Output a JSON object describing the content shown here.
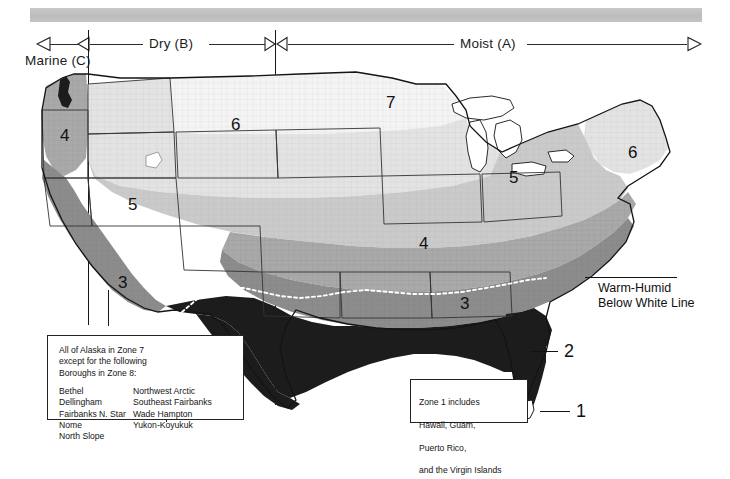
{
  "figure": {
    "type": "climate-zone-map",
    "region": "United States",
    "title": ""
  },
  "axis": {
    "marine_label": "Marine (C)",
    "dry_label": "Dry (B)",
    "moist_label": "Moist (A)",
    "marine_arrow": "arrow-left",
    "moist_arrow": "arrow-right",
    "divider_1_x": 88,
    "divider_2_x": 275
  },
  "zones": {
    "labels": [
      {
        "id": "zone-4-nw",
        "text": "4",
        "x": 60,
        "y": 127
      },
      {
        "id": "zone-5-west",
        "text": "5",
        "x": 128,
        "y": 196
      },
      {
        "id": "zone-3-ca",
        "text": "3",
        "x": 118,
        "y": 274
      },
      {
        "id": "zone-6-rockies",
        "text": "6",
        "x": 231,
        "y": 116
      },
      {
        "id": "zone-7-north",
        "text": "7",
        "x": 386,
        "y": 94
      },
      {
        "id": "zone-4-plains",
        "text": "4",
        "x": 419,
        "y": 235
      },
      {
        "id": "zone-5-midwest",
        "text": "5",
        "x": 509,
        "y": 169
      },
      {
        "id": "zone-6-northeast",
        "text": "6",
        "x": 628,
        "y": 144
      },
      {
        "id": "zone-3-south",
        "text": "3",
        "x": 460,
        "y": 295
      }
    ],
    "callouts": [
      {
        "id": "zone-2-callout",
        "text": "2",
        "x": 564,
        "y": 341,
        "leader_x": 530,
        "leader_y": 351,
        "leader_w": 28
      },
      {
        "id": "zone-1-callout",
        "text": "1",
        "x": 576,
        "y": 401,
        "leader_x": 540,
        "leader_y": 411,
        "leader_w": 30
      }
    ]
  },
  "annotations": {
    "warm_humid": {
      "line1": "Warm-Humid",
      "line2": "Below White Line",
      "x": 598,
      "y": 281,
      "leader_x": 585,
      "leader_y": 277,
      "leader_w": 92
    }
  },
  "legend_alaska": {
    "heading": "All of Alaska in Zone 7\nexcept for the following\nBoroughs in Zone 8:",
    "column_left": [
      "Bethel",
      "Dellingham",
      "Fairbanks N. Star",
      "Nome",
      "North Slope"
    ],
    "column_right": [
      "Northwest Arctic",
      "Southeast Fairbanks",
      "Wade Hampton",
      "Yukon-Koyukuk"
    ]
  },
  "legend_zone1": {
    "lines": [
      "Zone 1 includes",
      "Hawaii, Guam,",
      "Puerto Rico,",
      "and the Virgin Islands"
    ]
  },
  "colors": {
    "zone_7": "#f2f2f2",
    "zone_6": "#e0e0e0",
    "zone_5": "#c9c9c9",
    "zone_4": "#a8a8a8",
    "zone_3": "#8a8a8a",
    "zone_2": "#1c1c1c",
    "zone_1": "#111111",
    "county_line": "#9a9a9a",
    "state_line": "#3a3a3a",
    "banner": "#c4c4c4",
    "text": "#1a1a1a"
  }
}
